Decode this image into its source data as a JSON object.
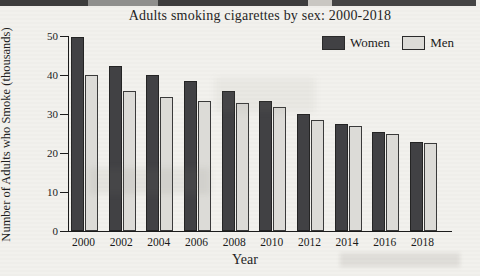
{
  "page": {
    "background_color": "#f2f1ed"
  },
  "chart_data": {
    "type": "bar",
    "title": "Adults smoking cigarettes by sex: 2000-2018",
    "xlabel": "Year",
    "ylabel": "Number of Adults who Smoke (thousands)",
    "categories": [
      "2000",
      "2002",
      "2004",
      "2006",
      "2008",
      "2010",
      "2012",
      "2014",
      "2016",
      "2018"
    ],
    "series": [
      {
        "name": "Women",
        "color": "#414144",
        "values": [
          50,
          42.5,
          40,
          38.5,
          36,
          33.5,
          30,
          27.5,
          25.5,
          23
        ]
      },
      {
        "name": "Men",
        "color": "#dcdbd7",
        "values": [
          40,
          36,
          34.5,
          33.5,
          33,
          32,
          28.5,
          27,
          25,
          22.5
        ]
      }
    ],
    "ylim": [
      0,
      50
    ],
    "yticks": [
      0,
      10,
      20,
      30,
      40,
      50
    ],
    "grid": false,
    "legend_position": "top-right"
  }
}
